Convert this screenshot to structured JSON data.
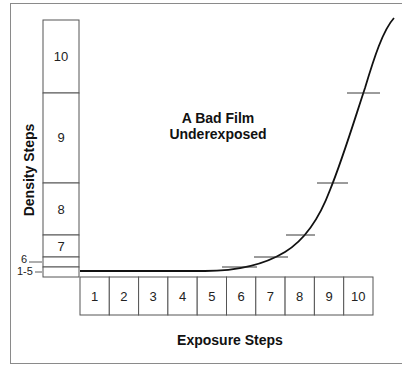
{
  "diagram": {
    "title_line1": "A Bad Film",
    "title_line2": "Underexposed",
    "x_axis_label": "Exposure Steps",
    "y_axis_label": "Density Steps",
    "density_steps": [
      {
        "label": "10",
        "top": 20,
        "bottom": 93
      },
      {
        "label": "9",
        "top": 93,
        "bottom": 183
      },
      {
        "label": "8",
        "top": 183,
        "bottom": 235
      },
      {
        "label": "7",
        "top": 235,
        "bottom": 257
      }
    ],
    "density_small_labels": [
      {
        "label": "6",
        "band_top": 257,
        "band_bottom": 267
      },
      {
        "label": "1-5",
        "band_top": 267,
        "band_bottom": 277
      }
    ],
    "exposure_steps": [
      "1",
      "2",
      "3",
      "4",
      "5",
      "6",
      "7",
      "8",
      "9",
      "10"
    ],
    "curve_description": "Characteristic curve: flat at minimum density through exposure steps 1-5, then rising steeply through steps 6-10",
    "tick_marks": [
      {
        "exposure_step": "5-6",
        "density": "6"
      },
      {
        "exposure_step": "6-7",
        "density": "7"
      },
      {
        "exposure_step": "7-8",
        "density": "8"
      },
      {
        "exposure_step": "8-9",
        "density": "9"
      },
      {
        "exposure_step": "9-10",
        "density": "10"
      }
    ],
    "colors": {
      "line": "#111111",
      "box_border": "#555555",
      "frame": "#8a8a8a",
      "background": "#ffffff"
    }
  }
}
